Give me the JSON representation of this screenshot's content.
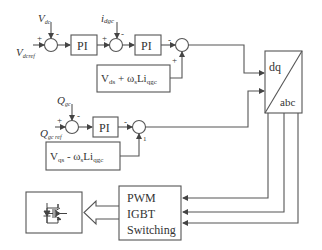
{
  "diagram": {
    "type": "grid-side converter control block diagram",
    "colors": {
      "stroke": "#555555",
      "text": "#333333",
      "background": "#ffffff"
    },
    "d_axis": {
      "feedback_label_main": "V",
      "feedback_label_sub": "dc",
      "reference_label_main": "V",
      "reference_label_sub": "dcref",
      "sum1_plus": "+",
      "sum1_minus": "-",
      "pi1_label": "PI",
      "current_label_main": "i",
      "current_label_sub": "dgc",
      "sum2_plus": "+",
      "sum2_minus": "-",
      "pi2_label": "PI",
      "sum3_minus": "-",
      "sum3_plus": "+",
      "feedforward_box": {
        "part1_main": "V",
        "part1_sub": "ds",
        "operator": " + ",
        "part2_main": "ω",
        "part2_sub": "s",
        "part3_main": "Li",
        "part3_sub": "qgc"
      }
    },
    "q_axis": {
      "feedback_label_main": "Q",
      "feedback_label_sub": "gc",
      "reference_label_main": "Q",
      "reference_label_sub": "gc ref",
      "sum1_plus": "+",
      "sum1_minus": "-",
      "pi_label": "PI",
      "sum2_minus": "-",
      "sum2_plus": "1",
      "feedforward_box": {
        "part1_main": "V",
        "part1_sub": "qs",
        "operator": " - ",
        "part2_main": "ω",
        "part2_sub": "s",
        "part3_main": "Li",
        "part3_sub": "qgc"
      }
    },
    "transform_block": {
      "top_label": "dq",
      "bottom_label": "abc"
    },
    "pwm_block": {
      "line1": "PWM",
      "line2": "IGBT",
      "line3": "Switching"
    },
    "igbt_block": {
      "icon": "igbt-with-diode-icon"
    }
  }
}
